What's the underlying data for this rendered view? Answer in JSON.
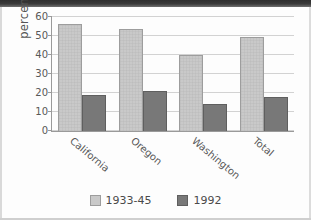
{
  "chart_data": {
    "type": "bar",
    "title": "",
    "xlabel": "",
    "ylabel": "percent",
    "categories": [
      "California",
      "Oregon",
      "Washington",
      "Total"
    ],
    "series": [
      {
        "name": "1933-45",
        "color": "#c9c9c9",
        "values": [
          56.5,
          53.5,
          40,
          49.5
        ]
      },
      {
        "name": "1992",
        "color": "#787878",
        "values": [
          19,
          21,
          14,
          18
        ]
      }
    ],
    "ylim": [
      0,
      60
    ],
    "yticks": [
      0,
      10,
      20,
      30,
      40,
      50,
      60
    ],
    "ytick_labels": [
      "0",
      "10",
      "20",
      "30",
      "40",
      "50",
      "60"
    ],
    "grid": true,
    "legend_position": "bottom"
  }
}
